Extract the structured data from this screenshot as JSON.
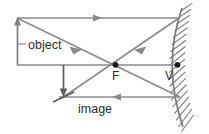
{
  "diagram": {
    "labels": {
      "object": "object",
      "image": "image",
      "focal_point": "F",
      "vertex": "V"
    },
    "colors": {
      "ray": "#8a8a8a",
      "object": "#7d7d7d",
      "image": "#5e5e5e",
      "mirror": "#7a7a7a",
      "point": "#1a1a1a",
      "text": "#2e2e2e",
      "background": "#ffffff"
    },
    "geometry": {
      "principal_axis": {
        "x1": 17,
        "y1": 65,
        "x2": 178,
        "y2": 65
      },
      "object_arrow": {
        "x": 17,
        "y_base": 65,
        "y_tip": 18
      },
      "image_arrow": {
        "x": 63,
        "y_base": 65,
        "y_tip": 97
      },
      "focal_point": {
        "x": 115,
        "y": 65
      },
      "vertex": {
        "x": 177,
        "y": 65
      },
      "mirror_arc": {
        "top_x": 181,
        "top_y": 10,
        "vertex_x": 177,
        "vertex_y": 65,
        "bottom_x": 181,
        "bottom_y": 125
      },
      "rays": [
        {
          "name": "incident-parallel-ray",
          "x1": 17,
          "y1": 18,
          "x2": 178,
          "y2": 18,
          "direction": "right"
        },
        {
          "name": "reflected-through-focus-ray",
          "x1": 178,
          "y1": 18,
          "x2": 63,
          "y2": 97,
          "direction": "down-left"
        },
        {
          "name": "incident-through-focus-ray",
          "x1": 17,
          "y1": 18,
          "x2": 180,
          "y2": 97,
          "direction": "down-right"
        },
        {
          "name": "reflected-parallel-ray",
          "x1": 180,
          "y1": 97,
          "x2": 60,
          "y2": 97,
          "direction": "left"
        }
      ]
    }
  }
}
